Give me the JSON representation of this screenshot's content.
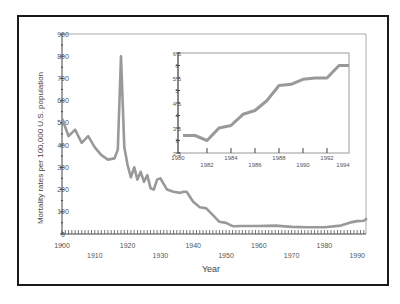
{
  "chart_data": [
    {
      "type": "line",
      "title": "",
      "xlabel": "Year",
      "ylabel": "Mortality rates per 100,000 U.S. population",
      "xlim": [
        1900,
        1993
      ],
      "ylim": [
        0,
        900
      ],
      "x_ticks": [
        1900,
        1910,
        1920,
        1930,
        1940,
        1950,
        1960,
        1970,
        1980,
        1990
      ],
      "y_ticks": [
        0,
        100,
        200,
        300,
        400,
        500,
        600,
        700,
        800,
        900
      ],
      "grid": false,
      "legend": null,
      "series": [
        {
          "name": "Mortality rate",
          "color": "#999999",
          "x": [
            1900,
            1901,
            1902,
            1904,
            1906,
            1908,
            1910,
            1912,
            1914,
            1916,
            1917,
            1918,
            1919,
            1920,
            1921,
            1922,
            1923,
            1924,
            1925,
            1926,
            1927,
            1928,
            1929,
            1930,
            1932,
            1934,
            1936,
            1937,
            1938,
            1940,
            1942,
            1944,
            1946,
            1948,
            1950,
            1952,
            1955,
            1960,
            1965,
            1970,
            1975,
            1980,
            1985,
            1988,
            1990,
            1992,
            1993
          ],
          "values": [
            520,
            480,
            440,
            470,
            410,
            440,
            390,
            355,
            335,
            340,
            380,
            800,
            390,
            310,
            255,
            300,
            245,
            280,
            235,
            265,
            205,
            200,
            245,
            250,
            200,
            190,
            185,
            190,
            190,
            145,
            120,
            115,
            85,
            55,
            50,
            35,
            36,
            36,
            38,
            32,
            30,
            30,
            38,
            52,
            58,
            60,
            70
          ]
        }
      ]
    },
    {
      "type": "line",
      "title": "",
      "xlabel": "",
      "ylabel": "",
      "xlim": [
        1980,
        1994
      ],
      "ylim": [
        2.5,
        6.5
      ],
      "x_ticks": [
        1980,
        1982,
        1984,
        1986,
        1988,
        1990,
        1992,
        1994
      ],
      "y_ticks": [
        2.5,
        3,
        3.5,
        4,
        4.5,
        5,
        5.5,
        6,
        6.5
      ],
      "grid": false,
      "legend": null,
      "series": [
        {
          "name": "Mortality rate (inset, 1980-1994)",
          "color": "#999999",
          "x": [
            1980,
            1981,
            1982,
            1983,
            1984,
            1985,
            1986,
            1987,
            1988,
            1989,
            1990,
            1991,
            1992,
            1993,
            1994
          ],
          "values": [
            3.2,
            3.2,
            3.0,
            3.5,
            3.6,
            4.05,
            4.2,
            4.6,
            5.2,
            5.25,
            5.45,
            5.5,
            5.5,
            6.0,
            6.0
          ]
        }
      ]
    }
  ],
  "labels": {
    "ylabel": "Mortality rates per 100,000 U.S. population",
    "xlabel": "Year",
    "main_y_ticks": [
      "0",
      "100",
      "200",
      "300",
      "400",
      "500",
      "600",
      "700",
      "800",
      "900"
    ],
    "main_x_ticks": [
      "1900",
      "1910",
      "1920",
      "1930",
      "1940",
      "1950",
      "1960",
      "1970",
      "1980",
      "1990"
    ],
    "inset_y_ticks": [
      "2.5",
      "3",
      "3.5",
      "4",
      "4.5",
      "5",
      "5.5",
      "6",
      "6.5"
    ],
    "inset_x_ticks": [
      "1980",
      "1982",
      "1984",
      "1986",
      "1988",
      "1990",
      "1992",
      "1994"
    ]
  }
}
